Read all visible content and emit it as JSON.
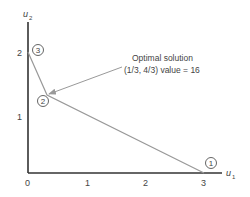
{
  "diagram": {
    "type": "linear-programming-feasible-region",
    "x_axis": {
      "label": "u",
      "subscript": "1",
      "ticks": [
        "0",
        "1",
        "2",
        "3"
      ]
    },
    "y_axis": {
      "label": "u",
      "subscript": "2",
      "ticks": [
        "1",
        "2"
      ]
    },
    "vertices": [
      {
        "id": "1",
        "label": "1",
        "coords": [
          3,
          0
        ]
      },
      {
        "id": "2",
        "label": "2",
        "coords": [
          0.3333,
          1.3333
        ]
      },
      {
        "id": "3",
        "label": "3",
        "coords": [
          0,
          2
        ]
      }
    ],
    "annotation": {
      "line1": "Optimal solution",
      "line2": "(1/3, 4/3)  value = 16",
      "points_to_vertex": "2"
    },
    "colors": {
      "axis": "#333333",
      "boundary": "#999999",
      "arrow": "#999999",
      "text": "#444444"
    }
  }
}
